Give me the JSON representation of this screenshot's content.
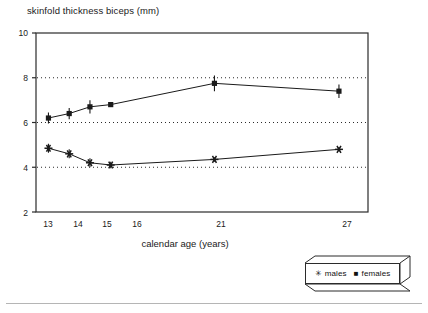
{
  "chart_data": {
    "type": "line",
    "title": "skinfold thickness biceps (mm)",
    "xlabel": "calendar age (years)",
    "ylabel": "",
    "x": [
      13,
      14,
      15,
      16,
      21,
      27
    ],
    "xtick_labels": [
      "13",
      "14",
      "15",
      "16",
      "21",
      "27"
    ],
    "ytick_labels": [
      "2",
      "4",
      "6",
      "8",
      "10"
    ],
    "yticks": [
      2,
      4,
      6,
      8,
      10
    ],
    "ylim": [
      2,
      10
    ],
    "xlim": [
      12.4,
      28.4
    ],
    "grid": "horizontal dotted gridlines at y = 4, 6, 8",
    "legend_position": "below-right, outside axes, 3D shadow box",
    "series": [
      {
        "name": "females",
        "marker": "filled-square",
        "values": [
          6.2,
          6.4,
          6.7,
          6.8,
          7.75,
          7.4
        ],
        "errors": [
          0.25,
          0.25,
          0.3,
          0.1,
          0.35,
          0.3
        ]
      },
      {
        "name": "males",
        "marker": "asterisk",
        "values": [
          4.85,
          4.6,
          4.2,
          4.1,
          4.35,
          4.8
        ],
        "errors": [
          0.2,
          0.2,
          0.2,
          0.15,
          0.1,
          0.1
        ]
      }
    ]
  },
  "legend": {
    "males_glyph": "✳",
    "males_label": "males",
    "females_glyph": "■",
    "females_label": "females"
  },
  "colors": {
    "line": "#1a1a1a",
    "grid": "#2b2b2b",
    "axis": "#2b2b2b",
    "background": "#ffffff",
    "rule": "#b5b5b5"
  }
}
